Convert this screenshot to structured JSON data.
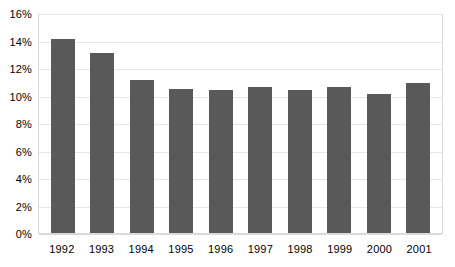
{
  "chart_data": {
    "type": "bar",
    "title": "",
    "subtitle": "",
    "xlabel": "",
    "ylabel": "",
    "categories": [
      "1992",
      "1993",
      "1994",
      "1995",
      "1996",
      "1997",
      "1998",
      "1999",
      "2000",
      "2001"
    ],
    "values": [
      14.1,
      13.1,
      11.1,
      10.5,
      10.4,
      10.6,
      10.4,
      10.6,
      10.1,
      10.9
    ],
    "value_suffix": "%",
    "ylim": [
      0,
      16
    ],
    "ytick_values": [
      0,
      2,
      4,
      6,
      8,
      10,
      12,
      14,
      16
    ],
    "ytick_labels": [
      "0%",
      "2%",
      "4%",
      "6%",
      "8%",
      "10%",
      "12%",
      "14%",
      "16%"
    ],
    "grid": true,
    "grid_axis": "y",
    "legend": false,
    "legend_position": "none",
    "series": [
      {
        "name": "",
        "values": [
          14.1,
          13.1,
          11.1,
          10.5,
          10.4,
          10.6,
          10.4,
          10.6,
          10.1,
          10.9
        ]
      }
    ],
    "annotations": []
  },
  "colors": {
    "bar": "#595959",
    "gridline": "#e6e6e6",
    "plot_border": "#d9d9d9",
    "background": "#ffffff",
    "text": "#000000"
  }
}
